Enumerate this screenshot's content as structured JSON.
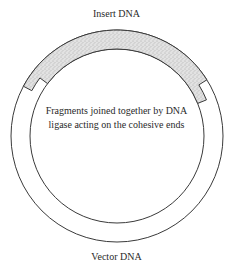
{
  "diagram": {
    "type": "plasmid-recombinant-dna",
    "labels": {
      "insert": "Insert DNA",
      "vector": "Vector DNA",
      "caption_line1": "Fragments joined together by DNA",
      "caption_line2": "ligase acting on the cohesive ends"
    },
    "colors": {
      "line": "#3a3a3a",
      "insert_fill": "#d8d8d8",
      "background": "#ffffff"
    },
    "geometry": {
      "center": [
        117,
        136
      ],
      "outer_radius": 106,
      "inner_radius": 87,
      "insert_outer_half_arc_deg": [
        32,
        152
      ],
      "insert_inner_half_arc_deg": [
        22,
        143
      ]
    }
  }
}
